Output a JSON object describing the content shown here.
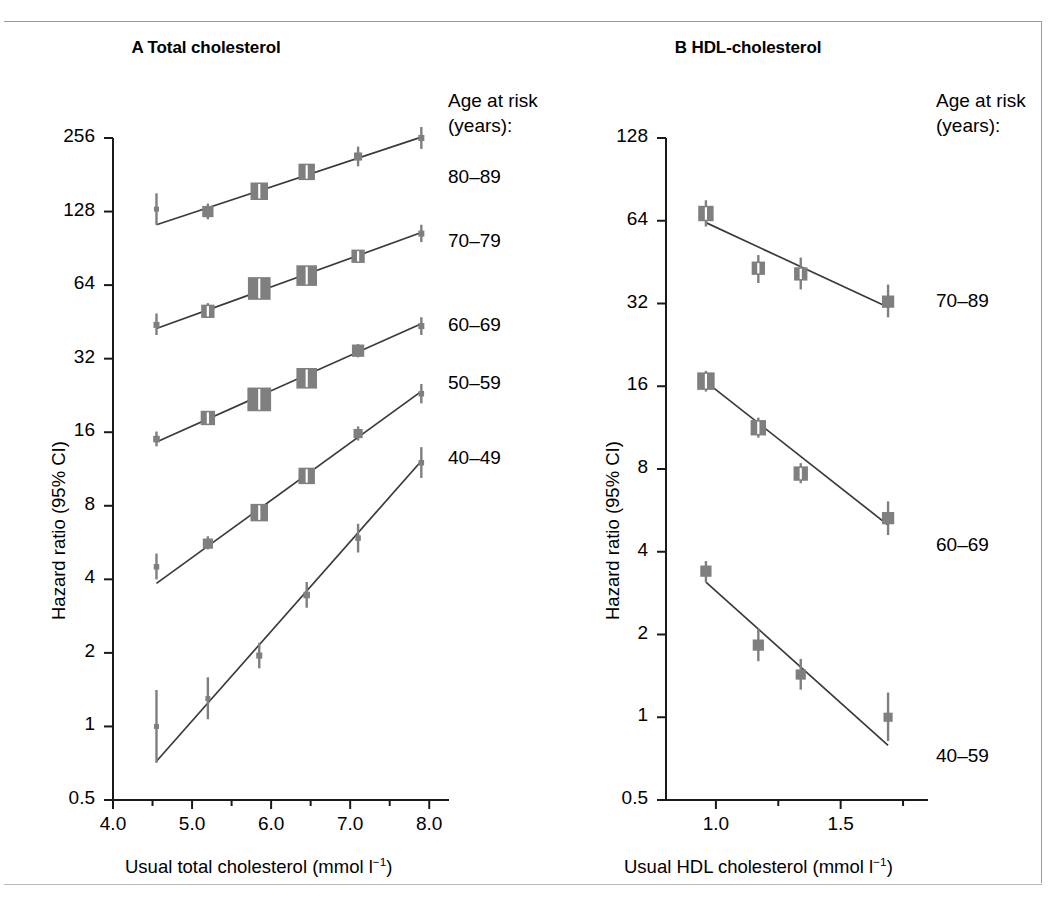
{
  "figure": {
    "background": "#ffffff",
    "marker_color": "#7f7f7f",
    "line_color": "#3a3a3a",
    "axis_color": "#1a1a1a"
  },
  "panel_a": {
    "title": "A Total cholesterol",
    "ylabel": "Hazard ratio (95% CI)",
    "xlabel_prefix": "Usual total cholesterol (mmol l",
    "xlabel_sup": "−1",
    "xlabel_suffix": ")",
    "ytick_labels": [
      "256",
      "128",
      "64",
      "32",
      "16",
      "8",
      "4",
      "2",
      "1",
      "0.5"
    ],
    "xtick_labels": [
      "4.0",
      "5.0",
      "6.0",
      "7.0",
      "8.0"
    ],
    "legend_title_line1": "Age at risk",
    "legend_title_line2": "(years):",
    "legend_items": [
      "80–89",
      "70–79",
      "60–69",
      "50–59",
      "40–49"
    ]
  },
  "panel_b": {
    "title": "B HDL-cholesterol",
    "ylabel": "Hazard ratio (95% CI)",
    "xlabel_prefix": "Usual HDL cholesterol (mmol l",
    "xlabel_sup": "−1",
    "xlabel_suffix": ")",
    "ytick_labels": [
      "128",
      "64",
      "32",
      "16",
      "8",
      "4",
      "2",
      "1",
      "0.5"
    ],
    "xtick_labels": [
      "1.0",
      "1.5"
    ],
    "legend_title_line1": "Age at risk",
    "legend_title_line2": "(years):",
    "legend_items": [
      "70–89",
      "60–69",
      "40–59"
    ]
  },
  "chart_data": [
    {
      "type": "scatter",
      "panel": "A",
      "title": "A Total cholesterol",
      "xlabel": "Usual total cholesterol (mmol l−1)",
      "ylabel": "Hazard ratio (95% CI)",
      "yscale": "log2",
      "ylim": [
        0.5,
        256
      ],
      "yticks": [
        0.5,
        1,
        2,
        4,
        8,
        16,
        32,
        64,
        128,
        256
      ],
      "xlim": [
        4.0,
        8.25
      ],
      "xticks": [
        4.0,
        5.0,
        6.0,
        7.0,
        8.0
      ],
      "xminorticks": [
        4.5,
        5.5,
        6.5,
        7.5
      ],
      "grid": false,
      "legend_position": "right",
      "series": [
        {
          "name": "80–89",
          "x": [
            4.55,
            5.2,
            5.85,
            6.45,
            7.1,
            7.9
          ],
          "values": [
            131,
            128,
            155,
            186,
            215,
            256
          ],
          "ci_low": [
            113,
            119,
            146,
            176,
            196,
            231
          ],
          "ci_high": [
            152,
            138,
            165,
            197,
            236,
            284
          ],
          "marker_weight": [
            1,
            2.2,
            3.4,
            3.2,
            1.6,
            1.2
          ],
          "fit_y_start": 113,
          "fit_y_end": 258
        },
        {
          "name": "70–79",
          "x": [
            4.55,
            5.2,
            5.85,
            6.45,
            7.1,
            7.9
          ],
          "values": [
            44,
            50,
            62,
            70,
            84,
            104
          ],
          "ci_low": [
            40,
            47,
            59,
            67,
            79,
            96
          ],
          "ci_high": [
            49,
            54,
            65,
            73,
            89,
            113
          ],
          "marker_weight": [
            1.2,
            2.6,
            4.4,
            4.0,
            2.6,
            1.2
          ],
          "fit_y_start": 42.5,
          "fit_y_end": 105
        },
        {
          "name": "60–69",
          "x": [
            4.55,
            5.2,
            5.85,
            6.45,
            7.1,
            7.9
          ],
          "values": [
            15.0,
            18.3,
            21.8,
            26.6,
            34.5,
            43.5
          ],
          "ci_low": [
            14.0,
            17.4,
            20.9,
            25.5,
            32.4,
            40.0
          ],
          "ci_high": [
            16.1,
            19.2,
            22.7,
            27.7,
            36.7,
            47.3
          ],
          "marker_weight": [
            1.3,
            2.8,
            4.6,
            4.0,
            2.4,
            1.2
          ],
          "fit_y_start": 14.6,
          "fit_y_end": 44.5
        },
        {
          "name": "50–59",
          "x": [
            4.55,
            5.2,
            5.85,
            6.45,
            7.1,
            7.9
          ],
          "values": [
            4.5,
            5.6,
            7.5,
            10.6,
            15.8,
            23.0
          ],
          "ci_low": [
            4.0,
            5.3,
            7.2,
            10.1,
            14.8,
            21.0
          ],
          "ci_high": [
            5.1,
            6.0,
            7.9,
            11.2,
            16.9,
            25.2
          ],
          "marker_weight": [
            1.1,
            2.0,
            3.4,
            3.2,
            1.8,
            1.1
          ],
          "fit_y_start": 3.85,
          "fit_y_end": 23.5
        },
        {
          "name": "40–49",
          "x": [
            4.55,
            5.2,
            5.85,
            6.45,
            7.1,
            7.9
          ],
          "values": [
            1.0,
            1.3,
            1.95,
            3.45,
            5.9,
            12.0
          ],
          "ci_low": [
            0.71,
            1.07,
            1.73,
            3.06,
            5.15,
            10.4
          ],
          "ci_high": [
            1.41,
            1.59,
            2.2,
            3.9,
            6.75,
            13.9
          ],
          "marker_weight": [
            1.0,
            1.0,
            1.2,
            1.3,
            1.1,
            1.1
          ],
          "fit_y_start": 0.72,
          "fit_y_end": 12.2
        }
      ]
    },
    {
      "type": "scatter",
      "panel": "B",
      "title": "B HDL-cholesterol",
      "xlabel": "Usual HDL cholesterol (mmol l−1)",
      "ylabel": "Hazard ratio (95% CI)",
      "yscale": "log2",
      "ylim": [
        0.5,
        128
      ],
      "yticks": [
        0.5,
        1,
        2,
        4,
        8,
        16,
        32,
        64,
        128
      ],
      "xlim": [
        0.8,
        1.85
      ],
      "xticks": [
        1.0,
        1.5
      ],
      "xminorticks": [
        1.25,
        1.75
      ],
      "grid": false,
      "legend_position": "right",
      "series": [
        {
          "name": "70–89",
          "x": [
            0.96,
            1.17,
            1.34,
            1.69
          ],
          "values": [
            68,
            43,
            41,
            32.5
          ],
          "ci_low": [
            61,
            38,
            36,
            28.5
          ],
          "ci_high": [
            76,
            48,
            47,
            37.5
          ],
          "marker_weight": [
            3.0,
            2.6,
            2.6,
            2.4
          ],
          "fit_y_start": 63,
          "fit_y_end": 31
        },
        {
          "name": "60–69",
          "x": [
            0.96,
            1.17,
            1.34,
            1.69
          ],
          "values": [
            16.7,
            11.3,
            7.7,
            5.3
          ],
          "ci_low": [
            15.3,
            10.4,
            7.1,
            4.6
          ],
          "ci_high": [
            18.2,
            12.3,
            8.4,
            6.1
          ],
          "marker_weight": [
            3.4,
            3.0,
            2.8,
            2.4
          ],
          "fit_y_start": 16.6,
          "fit_y_end": 5.0
        },
        {
          "name": "40–59",
          "x": [
            0.96,
            1.17,
            1.34,
            1.69
          ],
          "values": [
            3.4,
            1.83,
            1.43,
            1.0
          ],
          "ci_low": [
            3.1,
            1.6,
            1.26,
            0.82
          ],
          "ci_high": [
            3.7,
            2.1,
            1.63,
            1.23
          ],
          "marker_weight": [
            2.2,
            2.2,
            2.0,
            1.8
          ],
          "fit_y_start": 3.1,
          "fit_y_end": 0.79
        }
      ]
    }
  ]
}
